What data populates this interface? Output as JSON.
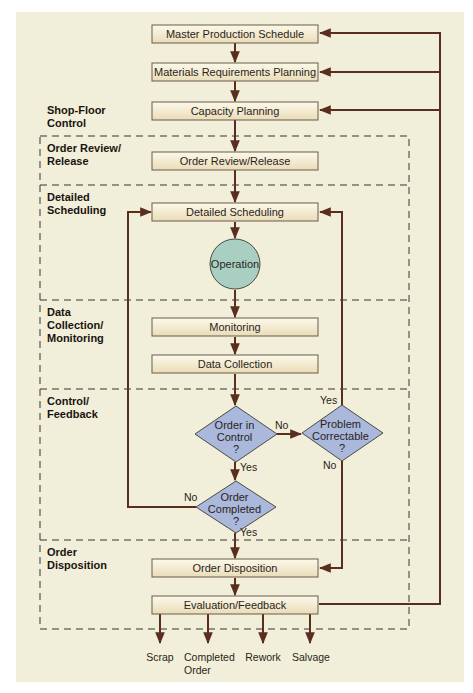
{
  "colors": {
    "background": "#f1eed9",
    "line": "#5a2e1e",
    "box_top": "#fbf7e6",
    "box_bottom": "#ece0bf",
    "box_border": "#6b5a4c",
    "operation_fill": "#a9cfc2",
    "decision_fill": "#a9b8db",
    "dash": "#3a3530"
  },
  "sections": [
    {
      "id": "shop-floor-control",
      "lines": [
        "Shop-Floor",
        "Control"
      ]
    },
    {
      "id": "order-review-release",
      "lines": [
        "Order Review/",
        "Release"
      ]
    },
    {
      "id": "detailed-scheduling",
      "lines": [
        "Detailed",
        "Scheduling"
      ]
    },
    {
      "id": "data-collection-monitoring",
      "lines": [
        "Data",
        "Collection/",
        "Monitoring"
      ]
    },
    {
      "id": "control-feedback",
      "lines": [
        "Control/",
        "Feedback"
      ]
    },
    {
      "id": "order-disposition",
      "lines": [
        "Order",
        "Disposition"
      ]
    }
  ],
  "boxes": {
    "mps": "Master Production Schedule",
    "mrp": "Materials Requirements Planning",
    "capacity": "Capacity Planning",
    "order_review": "Order Review/Release",
    "detailed_scheduling": "Detailed Scheduling",
    "monitoring": "Monitoring",
    "data_collection": "Data Collection",
    "order_disposition": "Order Disposition",
    "evaluation": "Evaluation/Feedback"
  },
  "operation": "Operation",
  "decisions": {
    "order_in_control": [
      "Order in",
      "Control",
      "?"
    ],
    "problem_correctable": [
      "Problem",
      "Correctable",
      "?"
    ],
    "order_completed": [
      "Order",
      "Completed",
      "?"
    ]
  },
  "edge_labels": {
    "in_control_no": "No",
    "in_control_yes": "Yes",
    "correctable_yes": "Yes",
    "correctable_no": "No",
    "completed_no": "No",
    "completed_yes": "Yes"
  },
  "outputs": [
    {
      "lines": [
        "Scrap"
      ]
    },
    {
      "lines": [
        "Completed",
        "Order"
      ]
    },
    {
      "lines": [
        "Rework"
      ]
    },
    {
      "lines": [
        "Salvage"
      ]
    }
  ]
}
